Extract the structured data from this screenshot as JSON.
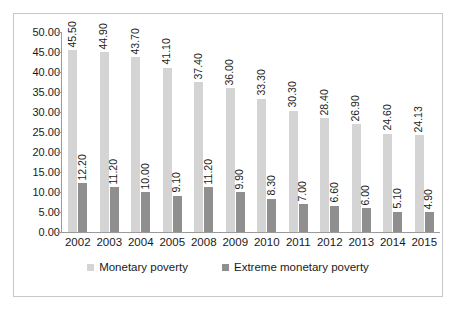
{
  "chart_data": {
    "type": "bar",
    "title": "",
    "subtitle": "",
    "xlabel": "",
    "ylabel": "",
    "ylim": [
      0,
      50
    ],
    "ytick_step": 5,
    "ytick_labels": [
      "0.00",
      "5.00",
      "10.00",
      "15.00",
      "20.00",
      "25.00",
      "30.00",
      "35.00",
      "40.00",
      "45.00",
      "50.00"
    ],
    "grid": false,
    "legend_position": "bottom",
    "data_labels": true,
    "data_label_rotation": -90,
    "categories": [
      "2002",
      "2003",
      "2004",
      "2005",
      "2008",
      "2009",
      "2010",
      "2011",
      "2012",
      "2013",
      "2014",
      "2015"
    ],
    "series": [
      {
        "name": "Monetary poverty",
        "color": "#d4d4d4",
        "values": [
          45.5,
          44.9,
          43.7,
          41.1,
          37.4,
          36.0,
          33.3,
          30.3,
          28.4,
          26.9,
          24.6,
          24.13
        ],
        "labels": [
          "45.50",
          "44.90",
          "43.70",
          "41.10",
          "37.40",
          "36.00",
          "33.30",
          "30.30",
          "28.40",
          "26.90",
          "24.60",
          "24.13"
        ]
      },
      {
        "name": "Extreme monetary poverty",
        "color": "#8f8f8f",
        "values": [
          12.2,
          11.2,
          10.0,
          9.1,
          11.2,
          9.9,
          8.3,
          7.0,
          6.6,
          6.0,
          5.1,
          4.9
        ],
        "labels": [
          "12.20",
          "11.20",
          "10.00",
          "9.10",
          "11.20",
          "9.90",
          "8.30",
          "7.00",
          "6.60",
          "6.00",
          "5.10",
          "4.90"
        ]
      }
    ]
  },
  "legend": {
    "items": [
      {
        "label": "Monetary poverty",
        "color": "#d4d4d4"
      },
      {
        "label": "Extreme monetary poverty",
        "color": "#8f8f8f"
      }
    ]
  },
  "colors": {
    "series_light": "#d4d4d4",
    "series_dark": "#8f8f8f",
    "axis": "#9a9a9a",
    "frame": "#c8c8c8",
    "text": "#1a1a1a",
    "background": "#ffffff"
  }
}
